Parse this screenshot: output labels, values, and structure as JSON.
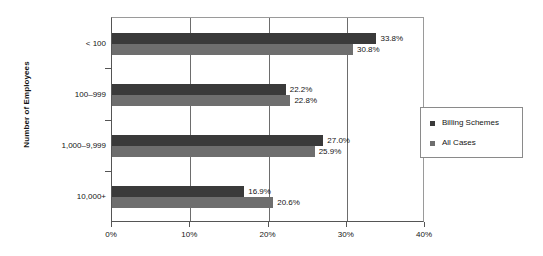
{
  "chart_data": {
    "type": "bar",
    "orientation": "horizontal",
    "title": "",
    "xlabel": "",
    "ylabel": "Number of Employees",
    "categories": [
      "< 100",
      "100–999",
      "1,000–9,999",
      "10,000+"
    ],
    "series": [
      {
        "name": "Billing Schemes",
        "color": "#3a3a3a",
        "values": [
          33.8,
          22.2,
          27.0,
          16.9
        ],
        "labels": [
          "33.8%",
          "22.2%",
          "27.0%",
          "16.9%"
        ]
      },
      {
        "name": "All Cases",
        "color": "#6e6e6e",
        "values": [
          30.8,
          22.8,
          25.9,
          20.6
        ],
        "labels": [
          "30.8%",
          "22.8%",
          "25.9%",
          "20.6%"
        ]
      }
    ],
    "xlim": [
      0,
      40
    ],
    "xticks": [
      0,
      10,
      20,
      30,
      40
    ],
    "xtick_labels": [
      "0%",
      "10%",
      "20%",
      "30%",
      "40%"
    ],
    "grid": "vertical",
    "legend_position": "right"
  },
  "legend": {
    "entries": [
      {
        "label": "Billing Schemes"
      },
      {
        "label": "All Cases"
      }
    ]
  }
}
